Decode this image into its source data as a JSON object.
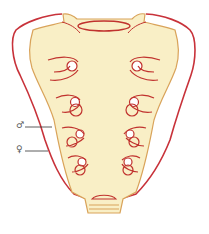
{
  "diagram": {
    "labels": {
      "male": "♂",
      "female": "♀"
    },
    "colors": {
      "bone_fill": "#f9efc6",
      "male_outline": "#d9a35a",
      "female_outline": "#c8323a",
      "foramina_lines": "#c0322e",
      "leader_line": "#333333"
    },
    "foramina_pairs": 4
  }
}
